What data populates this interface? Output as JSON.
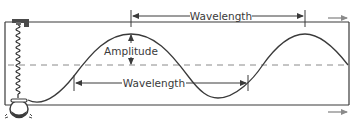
{
  "diagram": {
    "type": "transverse-wave",
    "labels": {
      "wavelength_top": "Wavelength",
      "wavelength_bottom": "Wavelength",
      "amplitude": "Amplitude"
    },
    "colors": {
      "line": "#3a3a3a",
      "dashed": "#888888",
      "arrow": "#7a7a7a"
    },
    "components": [
      "spring",
      "clamp",
      "weight",
      "frame",
      "wave",
      "midline",
      "motion-arrows"
    ]
  }
}
